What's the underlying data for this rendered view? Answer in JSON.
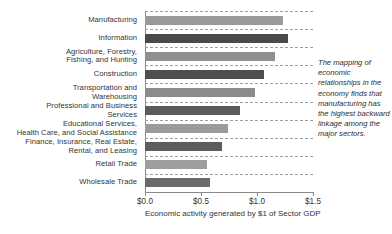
{
  "chart_data": {
    "type": "bar",
    "orientation": "horizontal",
    "title": "",
    "xlabel": "Economic activity generated by $1 of Sector GDP",
    "ylabel": "",
    "xlim": [
      0.0,
      1.5
    ],
    "xticks": [
      0.0,
      0.5,
      1.0,
      1.5
    ],
    "xtick_labels": [
      "$0.0",
      "$0.5",
      "$1.0",
      "$1.5"
    ],
    "grid": true,
    "grid_axis": "y",
    "grid_style": "dashed",
    "legend": false,
    "categories": [
      "Manufacturing",
      "Information",
      "Agriculture, Forestry,\nFishing, and Hunting",
      "Construction",
      "Transportation and\nWarehousing",
      "Professional and Business\nServices",
      "Educational Services,\nHealth Care, and Social Assistance",
      "Finance, Insurance, Real Estate,\nRental, and Leasing",
      "Retail Trade",
      "Wholesale Trade"
    ],
    "values": [
      1.23,
      1.28,
      1.16,
      1.06,
      0.98,
      0.85,
      0.74,
      0.69,
      0.55,
      0.58
    ],
    "bar_colors": [
      "#9a9a9a",
      "#4a4a4a",
      "#8f8f8f",
      "#4f4f4f",
      "#8b8b8b",
      "#5a5a5a",
      "#9b9b9b",
      "#5d5d5d",
      "#9e9e9e",
      "#6a6a6a"
    ]
  },
  "annotation": {
    "text": "The mapping of economic relationships in the economy finds that manufacturing has the highest backward linkage among the major sectors."
  }
}
